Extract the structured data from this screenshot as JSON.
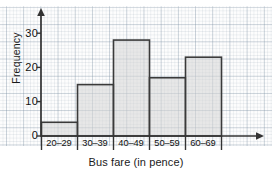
{
  "chart_data": {
    "type": "bar",
    "title": "",
    "subtitle": "",
    "xlabel": "Bus fare (in pence)",
    "ylabel": "Frequency",
    "categories": [
      "20–29",
      "30–39",
      "40–49",
      "50–59",
      "60–69"
    ],
    "values": [
      4,
      15,
      28,
      17,
      23
    ],
    "series": [
      {
        "name": "Frequency",
        "values": [
          4,
          15,
          28,
          17,
          23
        ]
      }
    ],
    "ylim": [
      0,
      33
    ],
    "yticks": [
      0,
      10,
      20,
      30
    ],
    "ytick_labels": [
      "0",
      "10",
      "20",
      "30"
    ],
    "grid": true,
    "grid_style": "graph-paper",
    "legend": false,
    "legend_position": "none",
    "annotations": [],
    "bar_fill_color": "#d5d5d5",
    "bar_edge_color": "#3a3a3a",
    "axis_color": "#333333",
    "grid_color": "#8fa3b5",
    "background_color": "#fdfdfd"
  },
  "axes": {
    "y_label": "Frequency",
    "x_label": "Bus fare (in pence)",
    "y_ticks": [
      {
        "value": "30"
      },
      {
        "value": "20"
      },
      {
        "value": "10"
      },
      {
        "value": "0"
      }
    ],
    "x_ticks": [
      {
        "label": "20–29"
      },
      {
        "label": "30–39"
      },
      {
        "label": "40–49"
      },
      {
        "label": "50–59"
      },
      {
        "label": "60–69"
      }
    ]
  },
  "artifacts": {
    "top_partial_glyph": ""
  }
}
